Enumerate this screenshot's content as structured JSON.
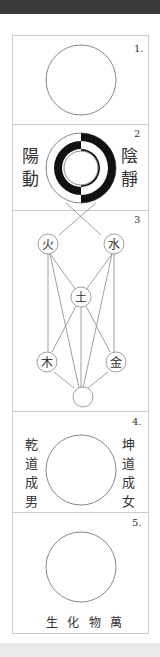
{
  "diagram": {
    "sections": [
      {
        "number": "1.",
        "name": "wuji-circle"
      },
      {
        "number": "2",
        "left_text": [
          "陽",
          "動"
        ],
        "right_text": [
          "陰",
          "靜"
        ]
      },
      {
        "number": "3",
        "elements": {
          "fire": "火",
          "water": "水",
          "earth": "土",
          "wood": "木",
          "metal": "金"
        }
      },
      {
        "number": "4.",
        "left_text": [
          "乾",
          "道",
          "成",
          "男"
        ],
        "right_text": [
          "坤",
          "道",
          "成",
          "女"
        ]
      },
      {
        "number": "5.",
        "caption": [
          "生",
          "化",
          "物",
          "萬"
        ]
      }
    ],
    "colors": {
      "line": "#888888",
      "ink": "#111111",
      "text": "#333333",
      "frame": "#cccccc"
    }
  }
}
